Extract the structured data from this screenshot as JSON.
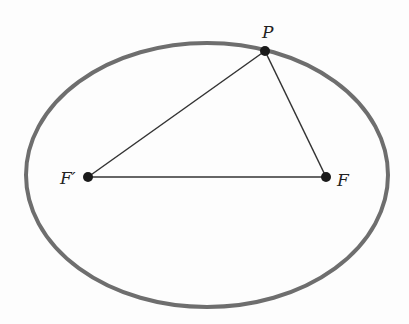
{
  "diagram": {
    "colors": {
      "ellipse": "#6e6e6e",
      "lines": "#333333",
      "points": "#1a1a1a",
      "background": "#fdfdfd"
    },
    "ellipse": {
      "cx": 207,
      "cy": 175,
      "rx": 181,
      "ry": 132,
      "stroke_width": 4
    },
    "points": [
      {
        "id": "P",
        "label": "P",
        "x": 265,
        "y": 51,
        "label_x": 262,
        "label_y": 38
      },
      {
        "id": "F_prime",
        "label": "F′",
        "x": 88,
        "y": 177,
        "label_x": 60,
        "label_y": 184
      },
      {
        "id": "F",
        "label": "F",
        "x": 326,
        "y": 177,
        "label_x": 337,
        "label_y": 186
      }
    ],
    "segments": [
      {
        "from": "F_prime",
        "to": "P"
      },
      {
        "from": "P",
        "to": "F"
      },
      {
        "from": "F_prime",
        "to": "F"
      }
    ]
  }
}
